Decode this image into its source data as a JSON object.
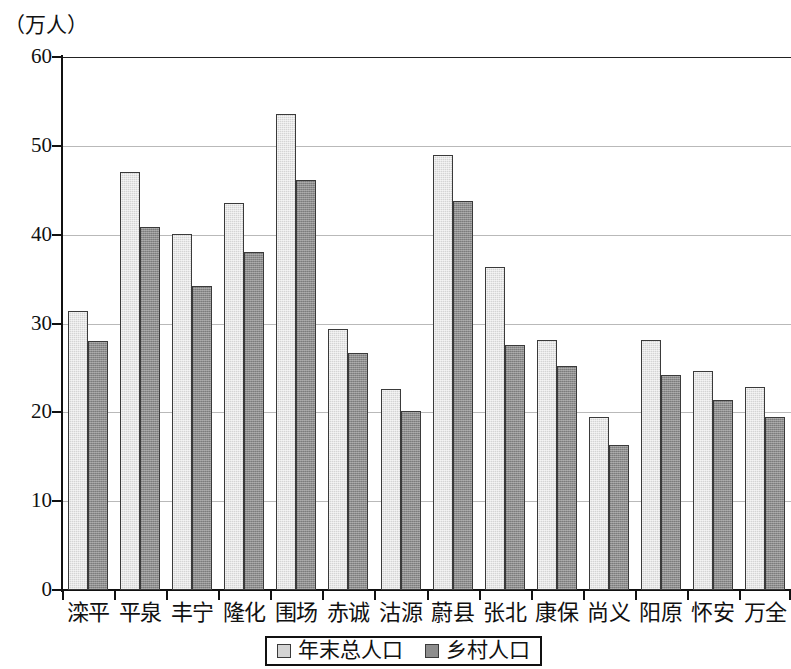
{
  "chart_data": {
    "type": "bar",
    "title": "",
    "subtitle": "",
    "unit_label": "（万人）",
    "xlabel": "",
    "ylabel": "",
    "ylim": [
      0,
      60
    ],
    "ytick_step": 10,
    "yticks": [
      0,
      10,
      20,
      30,
      40,
      50,
      60
    ],
    "grid": true,
    "grid_axis": "y",
    "legend_position": "bottom",
    "colors": {
      "total_population": "#d4d4d4",
      "rural_population": "#8d8d8d",
      "bar_outline": "#3a3a3a",
      "axis": "#111111",
      "gridline": "#b9b9b9",
      "background": "#ffffff"
    },
    "categories": [
      "滦平",
      "平泉",
      "丰宁",
      "隆化",
      "围场",
      "赤诚",
      "沽源",
      "蔚县",
      "张北",
      "康保",
      "尚义",
      "阳原",
      "怀安",
      "万全"
    ],
    "series": [
      {
        "name": "年末总人口",
        "key": "total",
        "values": [
          31.4,
          47.1,
          40.1,
          43.6,
          53.6,
          29.4,
          22.6,
          49.0,
          36.4,
          28.2,
          19.5,
          28.2,
          24.7,
          22.8
        ]
      },
      {
        "name": "乡村人口",
        "key": "rural",
        "values": [
          28.0,
          40.9,
          34.2,
          38.0,
          46.1,
          26.7,
          20.1,
          43.8,
          27.6,
          25.2,
          16.3,
          24.2,
          21.4,
          19.5
        ]
      }
    ]
  },
  "legend": {
    "items": [
      {
        "label": "年末总人口",
        "key": "total"
      },
      {
        "label": "乡村人口",
        "key": "rural"
      }
    ]
  },
  "axis": {
    "unit_caption": "（万人）",
    "y_tick_labels": [
      "60",
      "50",
      "40",
      "30",
      "20",
      "10",
      "0"
    ]
  }
}
